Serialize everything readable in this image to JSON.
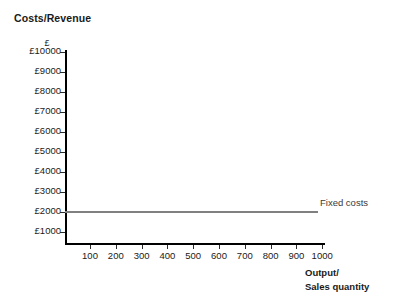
{
  "chart_data": {
    "type": "line",
    "title": "Costs/Revenue",
    "xlabel_line1": "Output/",
    "xlabel_line2": "Sales quantity",
    "ylabel": "£",
    "grid": false,
    "xlim": [
      0,
      1000
    ],
    "ylim": [
      0,
      10000
    ],
    "x_ticks": [
      {
        "value": 100,
        "label": "100"
      },
      {
        "value": 200,
        "label": "200"
      },
      {
        "value": 300,
        "label": "300"
      },
      {
        "value": 400,
        "label": "400"
      },
      {
        "value": 500,
        "label": "500"
      },
      {
        "value": 600,
        "label": "600"
      },
      {
        "value": 700,
        "label": "700"
      },
      {
        "value": 800,
        "label": "800"
      },
      {
        "value": 900,
        "label": "900"
      },
      {
        "value": 1000,
        "label": "1000"
      }
    ],
    "y_ticks": [
      {
        "value": 1000,
        "label": "£1000"
      },
      {
        "value": 2000,
        "label": "£2000"
      },
      {
        "value": 3000,
        "label": "£3000"
      },
      {
        "value": 4000,
        "label": "£4000"
      },
      {
        "value": 5000,
        "label": "£5000"
      },
      {
        "value": 6000,
        "label": "£6000"
      },
      {
        "value": 7000,
        "label": "£7000"
      },
      {
        "value": 8000,
        "label": "£8000"
      },
      {
        "value": 9000,
        "label": "£9000"
      },
      {
        "value": 10000,
        "label": "£10000"
      }
    ],
    "series": [
      {
        "name": "Fixed costs",
        "label": "Fixed costs",
        "color": "#808080",
        "x": [
          0,
          1000
        ],
        "values": [
          2000,
          2000
        ]
      }
    ],
    "annotations": [
      {
        "text": "Fixed costs",
        "x": 1010,
        "y": 2450
      }
    ]
  },
  "axes_color": "#000000"
}
